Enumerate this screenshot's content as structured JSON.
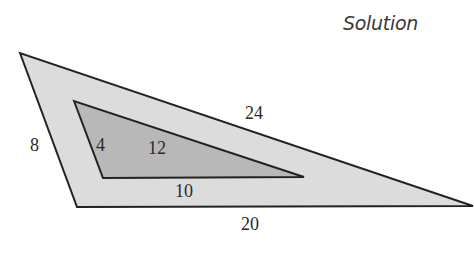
{
  "title": "Solution",
  "colors": {
    "outer_fill": "#dcdcdc",
    "inner_fill": "#b8b8b8",
    "stroke": "#222222",
    "background": "#ffffff"
  },
  "outer_triangle": {
    "vertices": [
      [
        20,
        53
      ],
      [
        77,
        207
      ],
      [
        473,
        206
      ]
    ],
    "labels": {
      "left_side": "8",
      "top_side": "24",
      "bottom_side": "20"
    }
  },
  "inner_triangle": {
    "vertices": [
      [
        74,
        101
      ],
      [
        103,
        178
      ],
      [
        304,
        177
      ]
    ],
    "labels": {
      "left_side": "4",
      "top_side": "12",
      "bottom_side": "10"
    }
  }
}
